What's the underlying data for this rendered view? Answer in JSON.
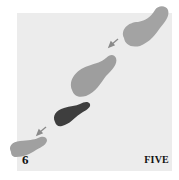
{
  "diagram": {
    "type": "dance-step-footprints",
    "step_number": "6",
    "step_name": "FIVE",
    "colors": {
      "background": "#ececec",
      "foot_light": "#a3a3a3",
      "foot_dark": "#3e3e3e",
      "arrow": "#8a8a8a",
      "text": "#111111"
    },
    "footprints": [
      {
        "id": "foot-1",
        "shade": "light",
        "position": "top-right"
      },
      {
        "id": "foot-2",
        "shade": "light",
        "position": "upper-middle"
      },
      {
        "id": "foot-3",
        "shade": "dark",
        "position": "center"
      },
      {
        "id": "foot-4",
        "shade": "light",
        "position": "bottom-left"
      }
    ],
    "arrows": [
      {
        "id": "arrow-1",
        "direction": "down-left",
        "between": [
          "foot-1",
          "foot-2"
        ]
      },
      {
        "id": "arrow-2",
        "direction": "down-left",
        "between": [
          "foot-3",
          "foot-4"
        ]
      }
    ]
  }
}
